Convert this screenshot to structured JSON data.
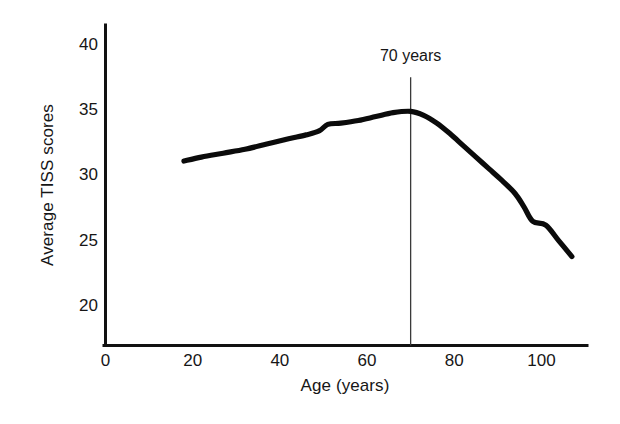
{
  "chart_data": {
    "type": "line",
    "title": "",
    "xlabel": "Age (years)",
    "ylabel": "Average TISS scores",
    "xlim": [
      0,
      110
    ],
    "ylim": [
      17,
      41.5
    ],
    "grid": false,
    "legend": false,
    "legend_position": "none",
    "xticks": [
      0,
      20,
      40,
      60,
      80,
      100
    ],
    "xticklabels": [
      "0",
      "20",
      "40",
      "60",
      "80",
      "100"
    ],
    "yticks": [
      20,
      25,
      30,
      35,
      40
    ],
    "yticklabels": [
      "20",
      "25",
      "30",
      "35",
      "40"
    ],
    "series": [
      {
        "name": "Average TISS score",
        "x": [
          18,
          22,
          27,
          32,
          37,
          42,
          46,
          49,
          51,
          54,
          58,
          62,
          66,
          70,
          73,
          76,
          79,
          82,
          85,
          88,
          91,
          94,
          96,
          98,
          101,
          104,
          107
        ],
        "values": [
          31.1,
          31.4,
          31.7,
          32.0,
          32.4,
          32.8,
          33.1,
          33.4,
          33.9,
          34.0,
          34.2,
          34.5,
          34.8,
          34.9,
          34.6,
          34.0,
          33.2,
          32.3,
          31.4,
          30.5,
          29.6,
          28.6,
          27.6,
          26.5,
          26.2,
          25.0,
          23.8
        ]
      }
    ],
    "annotations": [
      {
        "label": "70 years",
        "x": 70,
        "type": "vertical-reference-line",
        "line_top_value": 37.5,
        "line_bottom_value": 17
      }
    ]
  }
}
